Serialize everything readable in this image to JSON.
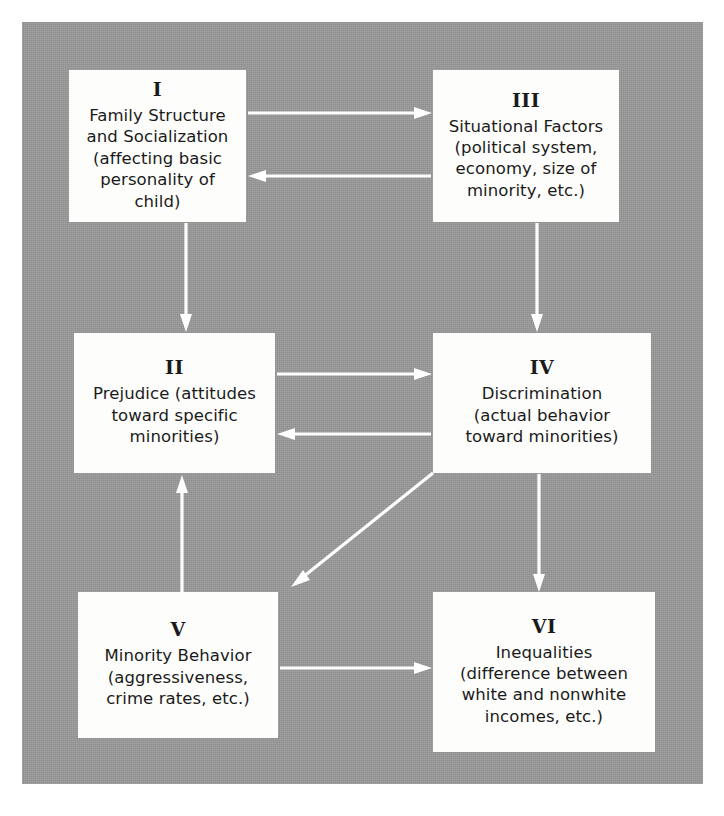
{
  "figure": {
    "background_color": "#9a9a9a",
    "node_fill_color": "#fdfdfb",
    "arrow_color": "#ffffff"
  },
  "nodes": [
    {
      "id": "I",
      "numeral": "I",
      "text": "Family Structure\nand Socialization\n(affecting basic\npersonality of child)"
    },
    {
      "id": "III",
      "numeral": "III",
      "text": "Situational Factors\n(political system,\neconomy, size of\nminority, etc.)"
    },
    {
      "id": "II",
      "numeral": "II",
      "text": "Prejudice (attitudes\ntoward specific\nminorities)"
    },
    {
      "id": "IV",
      "numeral": "IV",
      "text": "Discrimination\n(actual behavior\ntoward minorities)"
    },
    {
      "id": "V",
      "numeral": "V",
      "text": "Minority Behavior\n(aggressiveness,\ncrime rates, etc.)"
    },
    {
      "id": "VI",
      "numeral": "VI",
      "text": "Inequalities\n(difference between\nwhite and nonwhite\nincomes, etc.)"
    }
  ],
  "arrows": [
    {
      "name": "arrow-i-to-iii",
      "from": "I",
      "to": "III",
      "direction": "right"
    },
    {
      "name": "arrow-iii-to-i",
      "from": "III",
      "to": "I",
      "direction": "left"
    },
    {
      "name": "arrow-i-to-ii",
      "from": "I",
      "to": "II",
      "direction": "down"
    },
    {
      "name": "arrow-iii-to-iv",
      "from": "III",
      "to": "IV",
      "direction": "down"
    },
    {
      "name": "arrow-ii-to-iv",
      "from": "II",
      "to": "IV",
      "direction": "right"
    },
    {
      "name": "arrow-iv-to-ii",
      "from": "IV",
      "to": "II",
      "direction": "left"
    },
    {
      "name": "arrow-iv-to-v",
      "from": "IV",
      "to": "V",
      "direction": "diagonal-down-left"
    },
    {
      "name": "arrow-v-to-ii",
      "from": "V",
      "to": "II",
      "direction": "up"
    },
    {
      "name": "arrow-iv-to-vi",
      "from": "IV",
      "to": "VI",
      "direction": "down"
    },
    {
      "name": "arrow-v-to-vi",
      "from": "V",
      "to": "VI",
      "direction": "right"
    }
  ]
}
